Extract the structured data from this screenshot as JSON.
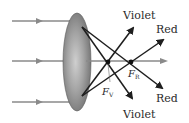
{
  "diagram": {
    "type": "converging-lens-chromatic-aberration",
    "labels": {
      "violet_top": "Violet",
      "red_top": "Red",
      "red_bottom": "Red",
      "violet_bottom": "Violet",
      "focus_violet_main": "F",
      "focus_violet_sub": "V",
      "focus_red_main": "F",
      "focus_red_sub": "R"
    },
    "colors": {
      "incoming_ray": "#8a8a8a",
      "refracted_ray": "#1e1e1e",
      "lens_fill": "#9a9a9a",
      "text": "#2b2b2b"
    }
  }
}
